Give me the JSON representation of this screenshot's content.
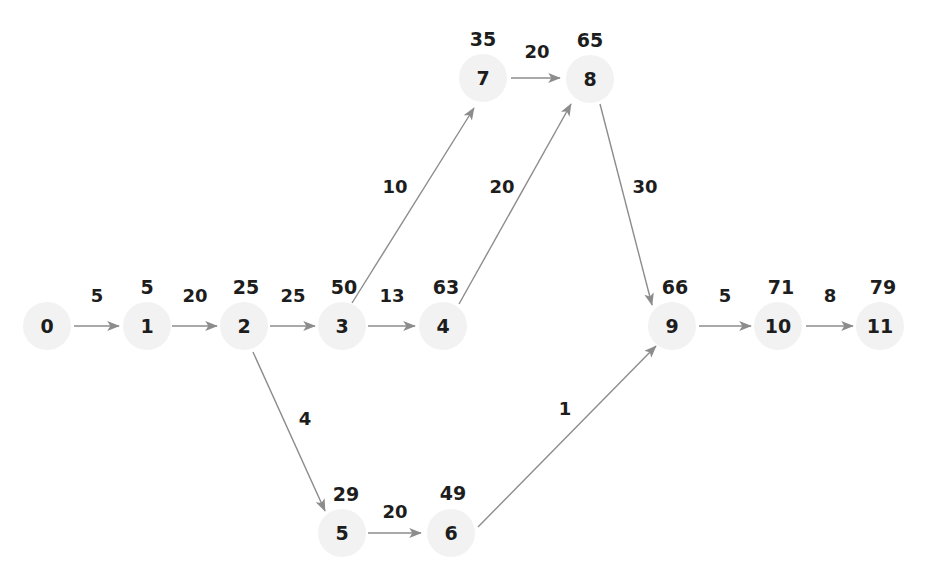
{
  "diagram": {
    "type": "directed-graph",
    "colors": {
      "node_halo": "#f2f2f2",
      "text": "#1d1d1d",
      "edge": "#8c8c8c",
      "background": "#ffffff"
    },
    "nodes": [
      {
        "id": "0",
        "label": "0",
        "distance": "",
        "x": 47,
        "y": 326,
        "dist_x": 47,
        "dist_y": 288
      },
      {
        "id": "1",
        "label": "1",
        "distance": "5",
        "x": 147,
        "y": 326,
        "dist_x": 147,
        "dist_y": 288
      },
      {
        "id": "2",
        "label": "2",
        "distance": "25",
        "x": 244,
        "y": 326,
        "dist_x": 246,
        "dist_y": 288
      },
      {
        "id": "3",
        "label": "3",
        "distance": "50",
        "x": 342,
        "y": 326,
        "dist_x": 344,
        "dist_y": 288
      },
      {
        "id": "4",
        "label": "4",
        "distance": "63",
        "x": 443,
        "y": 326,
        "dist_x": 446,
        "dist_y": 288
      },
      {
        "id": "5",
        "label": "5",
        "distance": "29",
        "x": 342,
        "y": 533,
        "dist_x": 346,
        "dist_y": 495
      },
      {
        "id": "6",
        "label": "6",
        "distance": "49",
        "x": 451,
        "y": 533,
        "dist_x": 453,
        "dist_y": 494
      },
      {
        "id": "7",
        "label": "7",
        "distance": "35",
        "x": 483,
        "y": 78,
        "dist_x": 483,
        "dist_y": 40
      },
      {
        "id": "8",
        "label": "8",
        "distance": "65",
        "x": 590,
        "y": 79,
        "dist_x": 590,
        "dist_y": 41
      },
      {
        "id": "9",
        "label": "9",
        "distance": "66",
        "x": 672,
        "y": 326,
        "dist_x": 675,
        "dist_y": 288
      },
      {
        "id": "10",
        "label": "10",
        "distance": "71",
        "x": 778,
        "y": 326,
        "dist_x": 781,
        "dist_y": 288
      },
      {
        "id": "11",
        "label": "11",
        "distance": "79",
        "x": 880,
        "y": 326,
        "dist_x": 883,
        "dist_y": 288
      }
    ],
    "edges": [
      {
        "from": "0",
        "to": "1",
        "weight": "5",
        "x1": 74,
        "y1": 326,
        "x2": 119,
        "y2": 326,
        "lx": 97,
        "ly": 297
      },
      {
        "from": "1",
        "to": "2",
        "weight": "20",
        "x1": 172,
        "y1": 326,
        "x2": 217,
        "y2": 326,
        "lx": 195,
        "ly": 297
      },
      {
        "from": "2",
        "to": "3",
        "weight": "25",
        "x1": 270,
        "y1": 326,
        "x2": 315,
        "y2": 326,
        "lx": 293,
        "ly": 297
      },
      {
        "from": "3",
        "to": "4",
        "weight": "13",
        "x1": 368,
        "y1": 326,
        "x2": 415,
        "y2": 326,
        "lx": 392,
        "ly": 297
      },
      {
        "from": "3",
        "to": "7",
        "weight": "10",
        "x1": 352,
        "y1": 303,
        "x2": 474,
        "y2": 108,
        "lx": 395,
        "ly": 188
      },
      {
        "from": "4",
        "to": "8",
        "weight": "20",
        "x1": 459,
        "y1": 304,
        "x2": 571,
        "y2": 104,
        "lx": 502,
        "ly": 188
      },
      {
        "from": "7",
        "to": "8",
        "weight": "20",
        "x1": 511,
        "y1": 78,
        "x2": 560,
        "y2": 78,
        "lx": 537,
        "ly": 53
      },
      {
        "from": "8",
        "to": "9",
        "weight": "30",
        "x1": 600,
        "y1": 104,
        "x2": 652,
        "y2": 305,
        "lx": 645,
        "ly": 188
      },
      {
        "from": "2",
        "to": "5",
        "weight": "4",
        "x1": 253,
        "y1": 352,
        "x2": 325,
        "y2": 511,
        "lx": 305,
        "ly": 420
      },
      {
        "from": "5",
        "to": "6",
        "weight": "20",
        "x1": 368,
        "y1": 533,
        "x2": 421,
        "y2": 533,
        "lx": 395,
        "ly": 513
      },
      {
        "from": "6",
        "to": "9",
        "weight": "1",
        "x1": 478,
        "y1": 527,
        "x2": 656,
        "y2": 346,
        "lx": 565,
        "ly": 410
      },
      {
        "from": "9",
        "to": "10",
        "weight": "5",
        "x1": 699,
        "y1": 326,
        "x2": 751,
        "y2": 326,
        "lx": 725,
        "ly": 297
      },
      {
        "from": "10",
        "to": "11",
        "weight": "8",
        "x1": 806,
        "y1": 326,
        "x2": 853,
        "y2": 326,
        "lx": 830,
        "ly": 297
      }
    ]
  }
}
